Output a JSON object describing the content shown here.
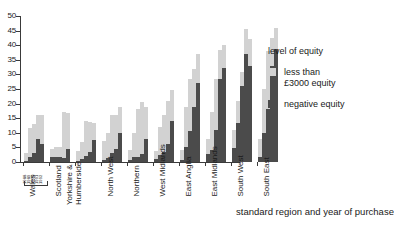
{
  "chart_data": {
    "type": "bar",
    "title": "",
    "subtitle": "",
    "xlabel": "standard region and year of purchase",
    "ylabel": "",
    "ylim": [
      0,
      50
    ],
    "ytick_labels": [
      "0",
      "5",
      "10",
      "15",
      "20",
      "25",
      "30",
      "35",
      "40",
      "45",
      "50"
    ],
    "ytick_values": [
      0,
      5,
      10,
      15,
      20,
      25,
      30,
      35,
      40,
      45,
      50
    ],
    "grid": false,
    "stacked": true,
    "legend_position": "right",
    "legend_title": "level of equity",
    "categories": [
      "Wales",
      "Scotland",
      "Yorkshire & Humberside",
      "North West",
      "Northern",
      "West Midlands",
      "East Anglia",
      "East Midlands",
      "South West",
      "South East"
    ],
    "subcategories": [
      "1988",
      "1989",
      "1990",
      "1991",
      "1992"
    ],
    "series": [
      {
        "name": "negative equity",
        "color": "#4b4b4b",
        "values": [
          [
            0.4,
            1.6,
            3.0,
            8.0,
            6.0
          ],
          [
            1.8,
            1.6,
            1.6,
            1.3,
            4.6
          ],
          [
            0.5,
            1.0,
            2.1,
            3.4,
            7.5
          ],
          [
            0.8,
            1.4,
            3.2,
            4.6,
            9.8
          ],
          [
            0.7,
            1.6,
            1.6,
            2.6,
            8.0
          ],
          [
            1.2,
            2.3,
            3.4,
            6.0,
            14.0
          ],
          [
            0.7,
            5.0,
            10.6,
            19.0,
            27.2
          ],
          [
            2.8,
            4.0,
            10.8,
            28.4,
            32.3
          ],
          [
            4.8,
            13.4,
            26.0,
            37.0,
            33.0
          ],
          [
            1.6,
            9.8,
            18.0,
            33.0,
            38.7
          ]
        ]
      },
      {
        "name": "less than £3000 equity",
        "color": "#d2d2d2",
        "values": [
          [
            2.8,
            10.0,
            10.0,
            8.0,
            10.0
          ],
          [
            2.8,
            3.4,
            3.4,
            15.7,
            12.3
          ],
          [
            3.2,
            6.0,
            11.9,
            10.3,
            6.0
          ],
          [
            6.4,
            8.6,
            13.0,
            11.4,
            9.2
          ],
          [
            3.3,
            8.4,
            16.4,
            17.8,
            11.0
          ],
          [
            2.6,
            9.7,
            12.8,
            15.0,
            10.8
          ],
          [
            3.3,
            14.0,
            17.7,
            13.0,
            9.8
          ],
          [
            5.2,
            13.0,
            17.7,
            10.0,
            7.7
          ],
          [
            6.2,
            7.4,
            5.0,
            8.5,
            9.0
          ],
          [
            6.2,
            15.2,
            20.0,
            9.5,
            7.3
          ]
        ]
      }
    ],
    "totals": [
      [
        3.2,
        11.6,
        13.0,
        16.0,
        16.0
      ],
      [
        4.6,
        5.0,
        5.0,
        17.0,
        16.9
      ],
      [
        3.7,
        7.0,
        14.0,
        13.7,
        13.5
      ],
      [
        7.2,
        10.0,
        16.2,
        16.0,
        19.0
      ],
      [
        4.0,
        10.0,
        18.0,
        20.4,
        19.0
      ],
      [
        3.8,
        12.0,
        16.2,
        21.0,
        24.8
      ],
      [
        4.0,
        19.0,
        28.3,
        32.0,
        37.0
      ],
      [
        8.0,
        17.0,
        28.5,
        38.4,
        40.0
      ],
      [
        11.0,
        20.8,
        31.0,
        45.5,
        42.0
      ],
      [
        7.8,
        25.0,
        38.0,
        42.5,
        46.0
      ]
    ]
  },
  "legend": {
    "title": "level of equity",
    "entries": [
      {
        "label_line1": "less than",
        "label_line2": "£3000 equity",
        "swatch": "light-gray-swatch"
      },
      {
        "label_line1": "negative equity",
        "label_line2": "",
        "swatch": "dark-gray-swatch"
      }
    ]
  },
  "axes": {
    "x_title": "standard region and year of purchase"
  },
  "colors": {
    "light_equity": "#d2d2d2",
    "negative_equity": "#4b4b4b",
    "axis": "#3a3a3a"
  }
}
